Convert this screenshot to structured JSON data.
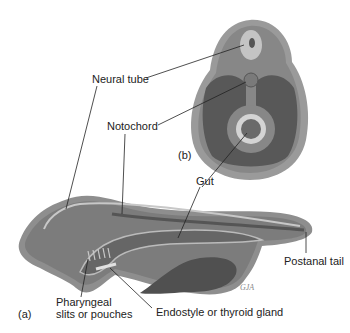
{
  "figure": {
    "panel_a_label": "(a)",
    "panel_b_label": "(b)",
    "labels": {
      "neural_tube": "Neural tube",
      "notochord": "Notochord",
      "gut": "Gut",
      "postanal_tail": "Postanal tail",
      "pharyngeal_line1": "Pharyngeal",
      "pharyngeal_line2": "slits or pouches",
      "endostyle": "Endostyle or thyroid gland"
    },
    "signature": "GJA"
  },
  "colors": {
    "outer_body": "#8a8a8a",
    "body_fill": "#7a7a7a",
    "dark_cavity": "#555555",
    "light_tube": "#c8c8c8",
    "leader_line": "#222222"
  }
}
